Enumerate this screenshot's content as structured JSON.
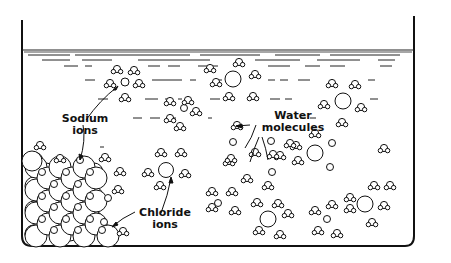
{
  "diagram": {
    "type": "illustration",
    "colors": {
      "ink": "#111111",
      "background": "#ffffff"
    },
    "labels": {
      "sodium": {
        "line1": "Sodium",
        "line2": "ions"
      },
      "water": {
        "line1": "Water",
        "line2": "molecules"
      },
      "chloride": {
        "line1": "Chloride",
        "line2": "ions"
      }
    },
    "components": [
      "beaker",
      "water-surface",
      "salt-crystal-lattice",
      "hydrated-sodium-ions",
      "hydrated-chloride-ions",
      "water-molecules"
    ]
  }
}
